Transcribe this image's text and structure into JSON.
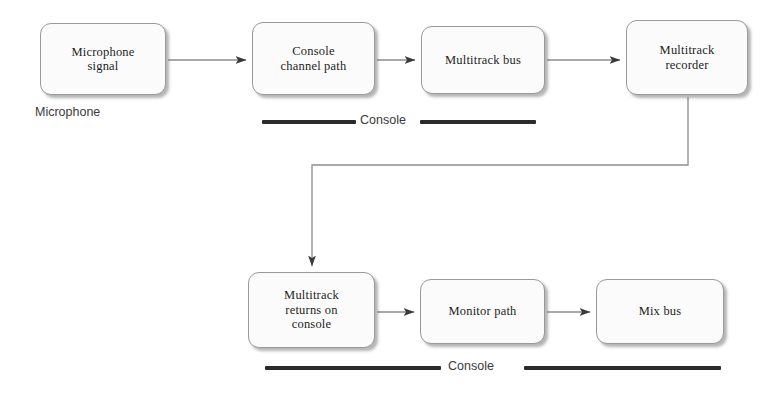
{
  "diagram": {
    "colors": {
      "box_fill": "#fbfbfb",
      "box_border": "#9a9a9a",
      "wire": "#8d8d8d",
      "arrowhead": "#3a3a3a",
      "rule": "#2b2b2b",
      "text": "#1d1d1d",
      "caption_text": "#3a3a3a",
      "background": "#ffffff"
    },
    "nodes": [
      {
        "id": "mic-signal",
        "label": "Microphone\nsignal",
        "x": 40,
        "y": 23,
        "w": 126,
        "h": 72
      },
      {
        "id": "console-channel",
        "label": "Console\nchannel path",
        "x": 252,
        "y": 22,
        "w": 123,
        "h": 73
      },
      {
        "id": "multitrack-bus",
        "label": "Multitrack bus",
        "x": 421,
        "y": 26,
        "w": 124,
        "h": 68
      },
      {
        "id": "multitrack-recorder",
        "label": "Multitrack\nrecorder",
        "x": 626,
        "y": 20,
        "w": 122,
        "h": 75
      },
      {
        "id": "multitrack-returns",
        "label": "Multitrack\nreturns on\nconsole",
        "x": 248,
        "y": 272,
        "w": 127,
        "h": 76
      },
      {
        "id": "monitor-path",
        "label": "Monitor path",
        "x": 420,
        "y": 279,
        "w": 125,
        "h": 65
      },
      {
        "id": "mix-bus",
        "label": "Mix bus",
        "x": 596,
        "y": 279,
        "w": 128,
        "h": 65
      }
    ],
    "captions": [
      {
        "id": "microphone-caption",
        "text": "Microphone",
        "x": 35,
        "y": 105
      }
    ],
    "brackets": [
      {
        "id": "console-bracket-top",
        "label": "Console",
        "label_x": 360,
        "label_y": 113,
        "rules": [
          {
            "x": 262,
            "y": 120,
            "w": 94
          },
          {
            "x": 420,
            "y": 120,
            "w": 116
          }
        ]
      },
      {
        "id": "console-bracket-bottom",
        "label": "Console",
        "label_x": 448,
        "label_y": 359,
        "rules": [
          {
            "x": 265,
            "y": 366,
            "w": 176
          },
          {
            "x": 524,
            "y": 366,
            "w": 197
          }
        ]
      }
    ],
    "connections": [
      {
        "id": "mic-to-channel",
        "from": "mic-signal",
        "to": "console-channel",
        "path": "M 168 60 L 246 60"
      },
      {
        "id": "channel-to-bus",
        "from": "console-channel",
        "to": "multitrack-bus",
        "path": "M 377 60 L 415 60"
      },
      {
        "id": "bus-to-recorder",
        "from": "multitrack-bus",
        "to": "multitrack-recorder",
        "path": "M 547 60 L 620 60"
      },
      {
        "id": "recorder-to-returns",
        "from": "multitrack-recorder",
        "to": "multitrack-returns",
        "path": "M 688 97 L 688 165 L 312 165 L 312 266"
      },
      {
        "id": "returns-to-monitor",
        "from": "multitrack-returns",
        "to": "monitor-path",
        "path": "M 377 312 L 414 312"
      },
      {
        "id": "monitor-to-mixbus",
        "from": "monitor-path",
        "to": "mix-bus",
        "path": "M 547 312 L 590 312"
      }
    ]
  }
}
